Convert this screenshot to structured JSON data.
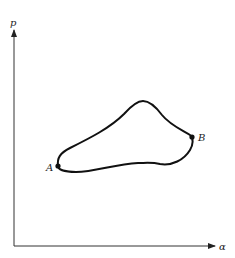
{
  "diagram": {
    "type": "p-alpha cycle diagram",
    "axes": {
      "y_label": "p",
      "x_label": "α"
    },
    "points": [
      {
        "id": "A",
        "label": "A"
      },
      {
        "id": "B",
        "label": "B"
      }
    ],
    "colors": {
      "line": "#111111",
      "background": "#ffffff"
    }
  }
}
